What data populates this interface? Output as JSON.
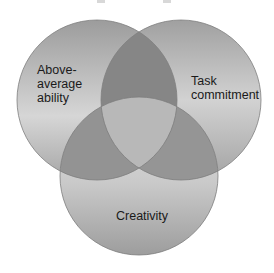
{
  "diagram": {
    "type": "venn",
    "circles": [
      {
        "id": "left",
        "label": "Above-\naverage\nability",
        "cx": 97,
        "cy": 100,
        "r": 80
      },
      {
        "id": "right",
        "label": "Task\ncommitment",
        "cx": 181,
        "cy": 100,
        "r": 80
      },
      {
        "id": "bottom",
        "label": "Creativity",
        "cx": 139,
        "cy": 176,
        "r": 79
      }
    ],
    "colors": {
      "outer_light": "#e2e2e2",
      "outer_dark": "#9a9a9a",
      "lens_top": "#858585",
      "lens_lower": "#929292",
      "center": "#b9b9b9",
      "edge": "#7a7a7a"
    }
  }
}
